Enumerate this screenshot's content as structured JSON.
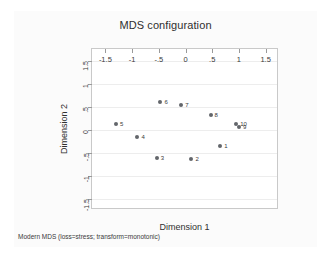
{
  "chart_data": {
    "type": "scatter",
    "title": "MDS configuration",
    "xlabel": "Dimension 1",
    "ylabel": "Dimension 2",
    "xlim": [
      -1.75,
      1.75
    ],
    "ylim": [
      -1.75,
      1.75
    ],
    "xticks": [
      "-1.5",
      "-1",
      "-.5",
      "0",
      ".5",
      "1",
      "1.5"
    ],
    "xtick_values": [
      -1.5,
      -1,
      -0.5,
      0,
      0.5,
      1,
      1.5
    ],
    "yticks": [
      "-1.5",
      "-1",
      "-.5",
      "0",
      ".5",
      "1",
      "1.5"
    ],
    "ytick_values": [
      -1.5,
      -1,
      -0.5,
      0,
      0.5,
      1,
      1.5
    ],
    "grid": "horizontal",
    "legend": "none",
    "marker_color": "#63666b",
    "note": "Modern MDS (loss=stress; transform=monotonic)",
    "points": [
      {
        "label": "5",
        "x": -1.3,
        "y": 0.13
      },
      {
        "label": "4",
        "x": -0.9,
        "y": -0.17
      },
      {
        "label": "3",
        "x": -0.54,
        "y": -0.61
      },
      {
        "label": "6",
        "x": -0.47,
        "y": 0.59
      },
      {
        "label": "7",
        "x": -0.08,
        "y": 0.53
      },
      {
        "label": "2",
        "x": 0.11,
        "y": -0.65
      },
      {
        "label": "8",
        "x": 0.47,
        "y": 0.31
      },
      {
        "label": "1",
        "x": 0.65,
        "y": -0.35
      },
      {
        "label": "10",
        "x": 0.95,
        "y": 0.12
      },
      {
        "label": "9",
        "x": 1.0,
        "y": 0.05
      }
    ]
  }
}
